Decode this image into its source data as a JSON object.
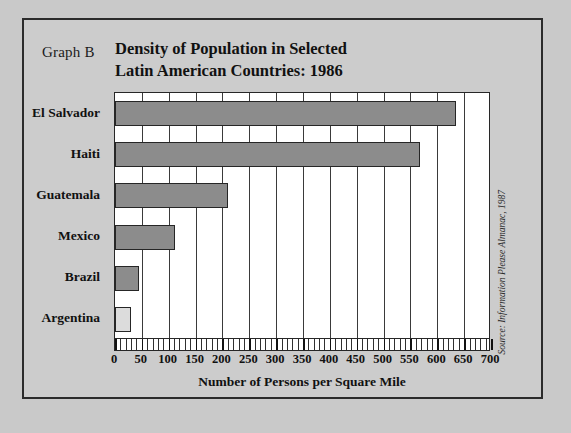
{
  "figure": {
    "graph_label": "Graph B",
    "title_line1": "Density of Population in Selected",
    "title_line2": "Latin American Countries: 1986",
    "source": "Source: Information Please Almanac, 1987"
  },
  "colors": {
    "page_background": "#c9c9c9",
    "panel_background": "#cccccc",
    "frame_border": "#2b2b2b",
    "plot_background": "#ffffff",
    "bar_fill": "#8c8c8c",
    "bar_fill_light": "#dcdcdc",
    "bar_stroke": "#262626",
    "gridline": "#3a3a3a",
    "text": "#111111"
  },
  "chart_data": {
    "type": "bar",
    "orientation": "horizontal",
    "title": "Density of Population in Selected Latin American Countries: 1986",
    "categories": [
      "El Salvador",
      "Haiti",
      "Guatemala",
      "Mexico",
      "Brazil",
      "Argentina"
    ],
    "values": [
      634,
      567,
      210,
      112,
      45,
      29
    ],
    "series": [
      {
        "name": "Persons per square mile",
        "values": [
          634,
          567,
          210,
          112,
          45,
          29
        ]
      }
    ],
    "xlabel": "Number of Persons per Square Mile",
    "ylabel": "",
    "xlim": [
      0,
      700
    ],
    "xticks": [
      0,
      50,
      100,
      150,
      200,
      250,
      300,
      350,
      400,
      450,
      500,
      550,
      600,
      650,
      700
    ],
    "xtick_labels": [
      "0",
      "50",
      "100",
      "150",
      "200",
      "250",
      "300",
      "350",
      "400",
      "450",
      "500",
      "550",
      "600",
      "650",
      "700"
    ],
    "minor_tick_interval": 10,
    "grid": true,
    "grid_axis": "x",
    "legend": false,
    "bar_colors": [
      "#8c8c8c",
      "#8c8c8c",
      "#8c8c8c",
      "#8c8c8c",
      "#8c8c8c",
      "#dcdcdc"
    ]
  }
}
